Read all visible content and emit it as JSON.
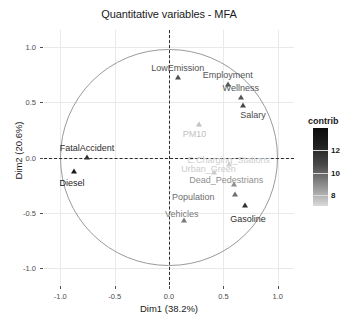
{
  "chart_data": {
    "type": "scatter",
    "title": "Quantitative variables - MFA",
    "xlabel": "Dim1 (38.2%)",
    "ylabel": "Dim2 (20.6%)",
    "xlim": [
      -1.15,
      1.15
    ],
    "ylim": [
      -1.15,
      1.15
    ],
    "xticks": [
      "-1.0",
      "-0.5",
      "0.0",
      "0.5",
      "1.0"
    ],
    "xtick_values": [
      -1.0,
      -0.5,
      0.0,
      0.5,
      1.0
    ],
    "yticks": [
      "-1.0",
      "-0.5",
      "0.0",
      "0.5",
      "1.0"
    ],
    "ytick_values": [
      -1.0,
      -0.5,
      0.0,
      0.5,
      1.0
    ],
    "grid": true,
    "correlation_circle": true,
    "points": [
      {
        "label": "LowEmission",
        "x": 0.08,
        "y": 0.73,
        "contrib": 11.5,
        "color": "#4f4f4f",
        "label_dx": 0,
        "label_dy": -9,
        "label_anchor": "middle"
      },
      {
        "label": "Employment",
        "x": 0.54,
        "y": 0.66,
        "contrib": 11.0,
        "color": "#555555",
        "label_dx": 0,
        "label_dy": -9,
        "label_anchor": "middle"
      },
      {
        "label": "Wellness",
        "x": 0.66,
        "y": 0.545,
        "contrib": 11.2,
        "color": "#555555",
        "label_dx": 0,
        "label_dy": -9,
        "label_anchor": "middle"
      },
      {
        "label": "Salary",
        "x": 0.68,
        "y": 0.47,
        "contrib": 11.0,
        "color": "#4a4a4a",
        "label_dx": 10,
        "label_dy": 10,
        "label_anchor": "middle"
      },
      {
        "label": "PM10",
        "x": 0.28,
        "y": 0.3,
        "contrib": 7.6,
        "color": "#c2c2c2",
        "label_dx": -5,
        "label_dy": 10,
        "label_anchor": "middle"
      },
      {
        "label": "FatalAccident",
        "x": -0.755,
        "y": 0.005,
        "contrib": 12.6,
        "color": "#2e2e2e",
        "label_dx": 0,
        "label_dy": -9,
        "label_anchor": "middle"
      },
      {
        "label": "Diesel",
        "x": -0.875,
        "y": -0.12,
        "contrib": 13.8,
        "color": "#1a1a1a",
        "label_dx": -2,
        "label_dy": 12,
        "label_anchor": "middle"
      },
      {
        "label": "E.Charging_Stations",
        "x": 0.55,
        "y": -0.055,
        "contrib": 7.2,
        "color": "#cfcfcf",
        "label_dx": 0,
        "label_dy": -4,
        "label_anchor": "middle"
      },
      {
        "label": "Urban_Green",
        "x": 0.41,
        "y": -0.135,
        "contrib": 7.3,
        "color": "#cbcbcb",
        "label_dx": -5,
        "label_dy": -3,
        "label_anchor": "middle"
      },
      {
        "label": "Dead_Pedestrians",
        "x": 0.6,
        "y": -0.235,
        "contrib": 9.0,
        "color": "#8f8f8f",
        "label_dx": -8,
        "label_dy": -4,
        "label_anchor": "middle"
      },
      {
        "label": "Population",
        "x": 0.61,
        "y": -0.325,
        "contrib": 10.4,
        "color": "#6e6e6e",
        "label_dx": -42,
        "label_dy": 3,
        "label_anchor": "middle"
      },
      {
        "label": "Gasoline",
        "x": 0.7,
        "y": -0.43,
        "contrib": 12.2,
        "color": "#2f2f2f",
        "label_dx": 3,
        "label_dy": 14,
        "label_anchor": "middle"
      },
      {
        "label": "Vehicles",
        "x": 0.135,
        "y": -0.565,
        "contrib": 9.8,
        "color": "#7a7a7a",
        "label_dx": -2,
        "label_dy": -6,
        "label_anchor": "middle"
      }
    ],
    "legend": {
      "title": "contrib",
      "position": "right",
      "ticks": [
        "12",
        "10",
        "8"
      ],
      "tick_values": [
        12,
        10,
        8
      ],
      "range": [
        7,
        14
      ],
      "gradient_high_color": "#0d0d0d",
      "gradient_low_color": "#d9d9d9"
    }
  }
}
